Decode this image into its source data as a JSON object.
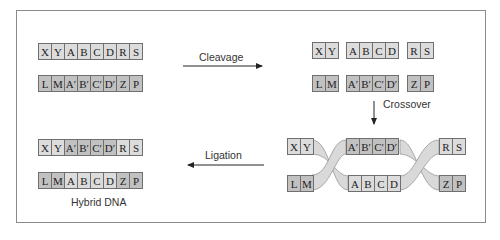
{
  "diagram": {
    "colors": {
      "light_segment": "#dcdcdc",
      "dark_segment": "#c1c1c1",
      "border": "#6f6f6f",
      "arrow": "#222222",
      "ribbon": "#d6d6d6"
    },
    "stage1": {
      "strand1": [
        "X",
        "Y",
        "A",
        "B",
        "C",
        "D",
        "R",
        "S"
      ],
      "strand2": [
        "L",
        "M",
        "A′",
        "B′",
        "C′",
        "D′",
        "Z",
        "P"
      ]
    },
    "steps": {
      "cleavage": "Cleavage",
      "crossover": "Crossover",
      "ligation": "Ligation"
    },
    "stage2": {
      "strand1_left": [
        "X",
        "Y"
      ],
      "strand1_mid": [
        "A",
        "B",
        "C",
        "D"
      ],
      "strand1_right": [
        "R",
        "S"
      ],
      "strand2_left": [
        "L",
        "M"
      ],
      "strand2_mid": [
        "A′",
        "B′",
        "C′",
        "D′"
      ],
      "strand2_right": [
        "Z",
        "P"
      ]
    },
    "stage3": {
      "top_left": [
        "X",
        "Y"
      ],
      "top_mid": [
        "A′",
        "B′",
        "C′",
        "D′"
      ],
      "top_right": [
        "R",
        "S"
      ],
      "bottom_left": [
        "L",
        "M"
      ],
      "bottom_mid": [
        "A",
        "B",
        "C",
        "D"
      ],
      "bottom_right": [
        "Z",
        "P"
      ]
    },
    "result": {
      "strand1": [
        "X",
        "Y",
        "A′",
        "B′",
        "C′",
        "D′",
        "R",
        "S"
      ],
      "strand2": [
        "L",
        "M",
        "A",
        "B",
        "C",
        "D",
        "Z",
        "P"
      ],
      "caption": "Hybrid DNA"
    }
  }
}
